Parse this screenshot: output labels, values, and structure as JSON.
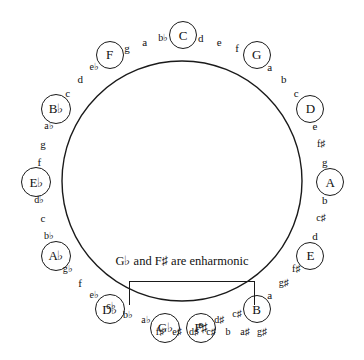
{
  "diagram": {
    "center_note": "G♭ and F♯ are enharmonic",
    "circle": {
      "center_x": 182,
      "center_y": 181,
      "radius": 120,
      "stroke_color": "#1a1a1a"
    },
    "keys": [
      {
        "label": "C",
        "angle_deg": 0,
        "label_radius": 147,
        "degrees": [
          "d",
          "e",
          "f"
        ]
      },
      {
        "label": "G",
        "angle_deg": 30,
        "label_radius": 147,
        "degrees": [
          "a",
          "b",
          "c"
        ]
      },
      {
        "label": "D",
        "angle_deg": 60,
        "label_radius": 147,
        "degrees": [
          "e",
          "f♯",
          "g"
        ]
      },
      {
        "label": "A",
        "angle_deg": 90,
        "label_radius": 147,
        "degrees": [
          "b",
          "c♯",
          "d"
        ]
      },
      {
        "label": "E",
        "angle_deg": 120,
        "label_radius": 147,
        "degrees": [
          "f♯",
          "g♯",
          "a"
        ]
      },
      {
        "label": "B",
        "angle_deg": 150,
        "label_radius": 147,
        "degrees": [
          "c♯",
          "d♯",
          "e"
        ]
      },
      {
        "label": "F♯",
        "angle_deg": 173,
        "label_radius": 147,
        "degrees": []
      },
      {
        "label": "G♭",
        "angle_deg": 187,
        "label_radius": 147,
        "degrees": [
          "a♭",
          "b♭",
          "c♭"
        ]
      },
      {
        "label": "D♭",
        "angle_deg": 210,
        "label_radius": 147,
        "degrees": [
          "e♭",
          "f",
          "g♭"
        ]
      },
      {
        "label": "A♭",
        "angle_deg": 240,
        "label_radius": 147,
        "degrees": [
          "b♭",
          "c",
          "d♭"
        ]
      },
      {
        "label": "E♭",
        "angle_deg": 270,
        "label_radius": 147,
        "degrees": [
          "f",
          "g",
          "a♭"
        ]
      },
      {
        "label": "B♭",
        "angle_deg": 300,
        "label_radius": 147,
        "degrees": [
          "c",
          "d",
          "e♭"
        ]
      },
      {
        "label": "F",
        "angle_deg": 330,
        "label_radius": 147,
        "degrees": [
          "g",
          "a",
          "b♭"
        ]
      }
    ],
    "bottom_sharp_run": [
      "g♯",
      "a♯",
      "b",
      "c♯",
      "d♯",
      "e♯",
      "f♯"
    ],
    "colors": {
      "background": "#ffffff",
      "ink": "#1a1a1a"
    }
  }
}
